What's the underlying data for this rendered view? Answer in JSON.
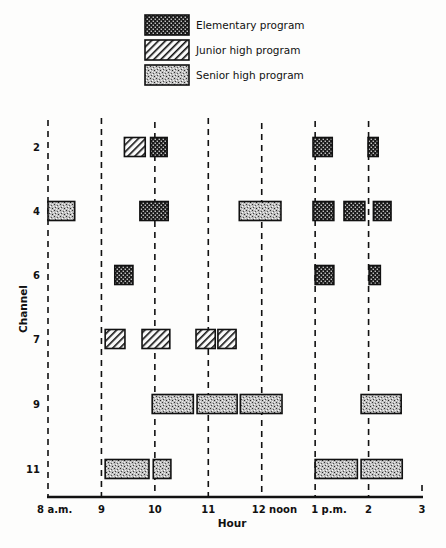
{
  "chart_data": {
    "type": "gantt",
    "title": "",
    "xlabel": "Hour",
    "ylabel": "Channel",
    "x_ticks": [
      {
        "label": "8 a.m.",
        "hour": 8
      },
      {
        "label": "9",
        "hour": 9
      },
      {
        "label": "10",
        "hour": 10
      },
      {
        "label": "11",
        "hour": 11
      },
      {
        "label": "12 noon",
        "hour": 12
      },
      {
        "label": "1 p.m.",
        "hour": 13
      },
      {
        "label": "2",
        "hour": 14
      },
      {
        "label": "3",
        "hour": 15
      }
    ],
    "xlim": [
      8,
      15
    ],
    "channels": [
      "2",
      "4",
      "6",
      "7",
      "9",
      "11"
    ],
    "legend": [
      {
        "key": "elementary",
        "label": "Elementary program",
        "pattern": "checker"
      },
      {
        "key": "junior",
        "label": "Junior high program",
        "pattern": "hatch"
      },
      {
        "key": "senior",
        "label": "Senior high program",
        "pattern": "stipple"
      }
    ],
    "legend_position": "top-center",
    "grid": "dashed vertical lines at each hour",
    "series": [
      {
        "channel": "2",
        "bars": [
          {
            "program": "junior",
            "start": 9.43,
            "end": 9.82
          },
          {
            "program": "elementary",
            "start": 9.92,
            "end": 10.23
          },
          {
            "program": "elementary",
            "start": 12.96,
            "end": 13.32
          },
          {
            "program": "elementary",
            "start": 13.99,
            "end": 14.18
          }
        ]
      },
      {
        "channel": "4",
        "bars": [
          {
            "program": "senior",
            "start": 8.0,
            "end": 8.5
          },
          {
            "program": "elementary",
            "start": 9.72,
            "end": 10.25
          },
          {
            "program": "senior",
            "start": 11.58,
            "end": 12.36
          },
          {
            "program": "elementary",
            "start": 12.96,
            "end": 13.35
          },
          {
            "program": "elementary",
            "start": 13.54,
            "end": 13.93
          },
          {
            "program": "elementary",
            "start": 14.09,
            "end": 14.42
          }
        ]
      },
      {
        "channel": "6",
        "bars": [
          {
            "program": "elementary",
            "start": 9.25,
            "end": 9.59
          },
          {
            "program": "elementary",
            "start": 13.0,
            "end": 13.35
          },
          {
            "program": "elementary",
            "start": 14.01,
            "end": 14.22
          }
        ]
      },
      {
        "channel": "7",
        "bars": [
          {
            "program": "junior",
            "start": 9.07,
            "end": 9.44
          },
          {
            "program": "junior",
            "start": 9.76,
            "end": 10.28
          },
          {
            "program": "junior",
            "start": 10.77,
            "end": 11.13
          },
          {
            "program": "junior",
            "start": 11.18,
            "end": 11.52
          }
        ]
      },
      {
        "channel": "9",
        "bars": [
          {
            "program": "senior",
            "start": 9.95,
            "end": 10.72
          },
          {
            "program": "senior",
            "start": 10.79,
            "end": 11.54
          },
          {
            "program": "senior",
            "start": 11.6,
            "end": 12.38
          },
          {
            "program": "senior",
            "start": 13.86,
            "end": 14.61
          }
        ]
      },
      {
        "channel": "11",
        "bars": [
          {
            "program": "senior",
            "start": 9.07,
            "end": 9.89
          },
          {
            "program": "senior",
            "start": 9.97,
            "end": 10.3
          },
          {
            "program": "senior",
            "start": 13.0,
            "end": 13.79
          },
          {
            "program": "senior",
            "start": 13.86,
            "end": 14.63
          }
        ]
      }
    ]
  }
}
